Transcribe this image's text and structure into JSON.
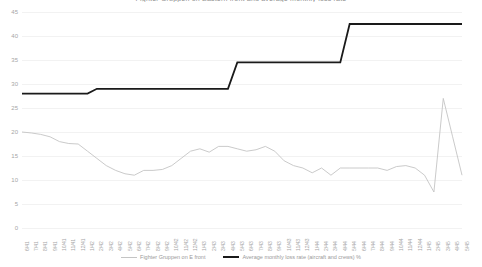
{
  "chart_data": {
    "type": "line",
    "title": "Fighter Gruppen on Eastern front and average monthly loss rate",
    "xlabel": "",
    "ylabel": "",
    "ylim": [
      0,
      45
    ],
    "yticks": [
      0,
      5,
      10,
      15,
      20,
      25,
      30,
      35,
      40,
      45
    ],
    "grid": true,
    "legend_position": "bottom",
    "colors": {
      "fighter_gruppen": "#c4c4c4",
      "loss_rate": "#1a1a1a",
      "gridline": "#f2f2f2",
      "tick_text": "#a6a6a6"
    },
    "categories": [
      "6/41",
      "7/41",
      "8/41",
      "9/41",
      "10/41",
      "11/41",
      "12/41",
      "1/42",
      "2/42",
      "3/42",
      "4/42",
      "5/42",
      "6/42",
      "7/42",
      "8/42",
      "9/42",
      "10/42",
      "11/42",
      "12/42",
      "1/43",
      "2/43",
      "3/43",
      "4/43",
      "5/43",
      "6/43",
      "7/43",
      "8/43",
      "9/43",
      "10/43",
      "11/43",
      "12/43",
      "1/44",
      "2/44",
      "3/44",
      "4/44",
      "5/44",
      "6/44",
      "7/44",
      "8/44",
      "9/44",
      "10/44",
      "11/44",
      "12/44",
      "1/45",
      "2/45",
      "3/45",
      "4/45",
      "5/45"
    ],
    "series": [
      {
        "name": "Fighter Gruppen on E front",
        "style": "thin-line",
        "color": "#c4c4c4",
        "values": [
          20.0,
          19.8,
          19.5,
          19.0,
          18.0,
          17.6,
          17.5,
          16.0,
          14.5,
          13.0,
          12.0,
          11.3,
          11.0,
          12.0,
          12.0,
          12.2,
          13.0,
          14.5,
          16.0,
          16.5,
          15.8,
          17.0,
          17.0,
          16.5,
          16.0,
          16.3,
          17.0,
          16.0,
          14.0,
          13.0,
          12.5,
          11.5,
          12.5,
          11.0,
          12.5,
          12.5,
          12.5,
          12.5,
          12.5,
          12.0,
          12.8,
          13.0,
          12.5,
          11.0,
          9.5,
          8.0,
          7.5,
          7.5
        ]
      },
      {
        "name": "Average monthly loss rate (aircraft and crews) %",
        "style": "thick-step",
        "color": "#1a1a1a",
        "values": [
          28.0,
          28.0,
          28.0,
          28.0,
          28.0,
          28.0,
          28.0,
          28.0,
          29.0,
          29.0,
          29.0,
          29.0,
          29.0,
          29.0,
          29.0,
          29.0,
          29.0,
          29.0,
          29.0,
          29.0,
          29.0,
          29.0,
          29.0,
          34.5,
          34.5,
          34.5,
          34.5,
          34.5,
          34.5,
          34.5,
          34.5,
          34.5,
          34.5,
          34.5,
          34.5,
          42.5,
          42.5,
          42.5,
          42.5,
          42.5,
          42.5,
          42.5,
          42.5,
          42.5,
          42.5,
          42.5,
          42.5,
          42.5
        ]
      }
    ],
    "spike_series_note": {
      "name": "Fighter Gruppen on E front",
      "tail_values": [
        7.5,
        27.0,
        19.0,
        11.0
      ]
    }
  },
  "legend": {
    "items": [
      {
        "label": "Fighter Gruppen on E front",
        "swatch": "thin"
      },
      {
        "label": "Average monthly loss rate (aircraft and crews) %",
        "swatch": "thick"
      }
    ]
  }
}
